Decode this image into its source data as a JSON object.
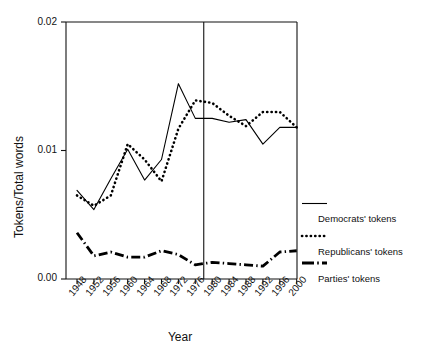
{
  "chart_data": {
    "type": "line",
    "title": "",
    "xlabel": "Year",
    "ylabel": "Tokens/Total words",
    "x": [
      1948,
      1952,
      1956,
      1960,
      1964,
      1968,
      1972,
      1976,
      1980,
      1984,
      1988,
      1992,
      1996,
      2000
    ],
    "categories": [
      "1948",
      "1952",
      "1956",
      "1960",
      "1964",
      "1968",
      "1972",
      "1976",
      "1980",
      "1984",
      "1988",
      "1992",
      "1996",
      "2000"
    ],
    "xlim": [
      1946,
      2002
    ],
    "ylim": [
      0.0,
      0.02
    ],
    "yticks": [
      0.0,
      0.01,
      0.02
    ],
    "ytick_labels": [
      "0.00",
      "0.01",
      "0.02"
    ],
    "grid": false,
    "legend_position": "right",
    "series": [
      {
        "name": "Democrats' tokens",
        "style": "solid",
        "color": "#000000",
        "values": [
          0.0069,
          0.0054,
          0.0078,
          0.0101,
          0.0077,
          0.0093,
          0.0152,
          0.0125,
          0.0125,
          0.0122,
          0.0124,
          0.0105,
          0.0118,
          0.0118
        ]
      },
      {
        "name": "Republicans' tokens",
        "style": "dotted",
        "color": "#000000",
        "values": [
          0.0065,
          0.0057,
          0.0065,
          0.0105,
          0.0093,
          0.0076,
          0.0117,
          0.0139,
          0.0137,
          0.0127,
          0.0119,
          0.013,
          0.013,
          0.0118
        ]
      },
      {
        "name": "Parties' tokens",
        "style": "dash-dot",
        "color": "#000000",
        "values": [
          0.0036,
          0.0018,
          0.0021,
          0.0017,
          0.0017,
          0.0022,
          0.0019,
          0.0011,
          0.0013,
          0.0012,
          0.0011,
          0.001,
          0.0021,
          0.0022
        ]
      }
    ],
    "annotations": [
      {
        "type": "vertical-reference-line",
        "x": 1978,
        "label": ""
      }
    ]
  },
  "legend": {
    "entries": [
      {
        "label": "Democrats' tokens",
        "swatch": "solid-line-swatch"
      },
      {
        "label": "Republicans' tokens",
        "swatch": "dotted-line-swatch"
      },
      {
        "label": "Parties' tokens",
        "swatch": "dash-dot-line-swatch"
      }
    ]
  },
  "axes": {
    "y_title": "Tokens/Total words",
    "x_title": "Year",
    "y_tick_labels": [
      "0.02",
      "0.01",
      "0.00"
    ],
    "x_tick_labels": [
      "1948",
      "1952",
      "1956",
      "1960",
      "1964",
      "1968",
      "1972",
      "1976",
      "1980",
      "1984",
      "1988",
      "1992",
      "1996",
      "2000"
    ]
  }
}
